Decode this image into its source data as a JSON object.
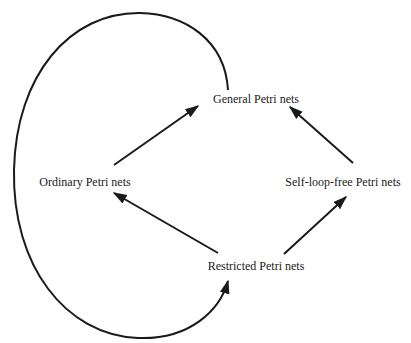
{
  "diagram": {
    "type": "hierarchy",
    "colors": {
      "background": "#ffffff",
      "stroke": "#1a1a1a",
      "text": "#1a1a1a"
    },
    "nodes": [
      {
        "id": "general",
        "label": "General Petri nets",
        "x": 256,
        "y": 99
      },
      {
        "id": "ordinary",
        "label": "Ordinary Petri nets",
        "x": 85,
        "y": 182
      },
      {
        "id": "selfloopfree",
        "label": "Self-loop-free Petri nets",
        "x": 343,
        "y": 182
      },
      {
        "id": "restricted",
        "label": "Restricted Petri nets",
        "x": 256,
        "y": 266
      }
    ],
    "edges": [
      {
        "from": "ordinary",
        "to": "general",
        "kind": "straight-arrow"
      },
      {
        "from": "selfloopfree",
        "to": "general",
        "kind": "straight-arrow"
      },
      {
        "from": "restricted",
        "to": "ordinary",
        "kind": "straight-arrow"
      },
      {
        "from": "restricted",
        "to": "selfloopfree",
        "kind": "straight-arrow"
      },
      {
        "from": "general",
        "to": "restricted",
        "kind": "curved-arrow",
        "route": "loops around left side"
      }
    ]
  }
}
